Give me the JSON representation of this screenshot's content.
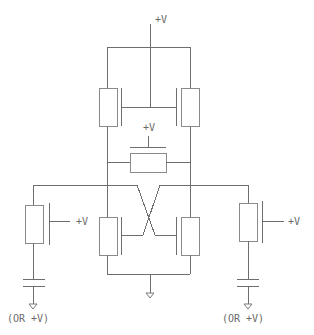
{
  "diagram": {
    "type": "circuit-schematic",
    "colors": {
      "line": "#6e6e6e",
      "background": "#ffffff",
      "text": "#6a6a6a"
    },
    "labels": {
      "supply_top": "+V",
      "supply_load": "+V",
      "supply_left_access": "+V",
      "supply_right_access": "+V",
      "left_cap_note": "(OR  +V)",
      "right_cap_note": "(OR  +V)"
    },
    "components": [
      {
        "id": "top-left-load-transistor",
        "kind": "transistor"
      },
      {
        "id": "top-right-load-transistor",
        "kind": "transistor"
      },
      {
        "id": "center-resistor",
        "kind": "resistor"
      },
      {
        "id": "left-cross-transistor",
        "kind": "transistor"
      },
      {
        "id": "right-cross-transistor",
        "kind": "transistor"
      },
      {
        "id": "left-access-transistor",
        "kind": "transistor"
      },
      {
        "id": "right-access-transistor",
        "kind": "transistor"
      },
      {
        "id": "left-capacitor",
        "kind": "capacitor"
      },
      {
        "id": "right-capacitor",
        "kind": "capacitor"
      },
      {
        "id": "center-ground",
        "kind": "ground"
      },
      {
        "id": "left-ground",
        "kind": "ground"
      },
      {
        "id": "right-ground",
        "kind": "ground"
      }
    ]
  }
}
